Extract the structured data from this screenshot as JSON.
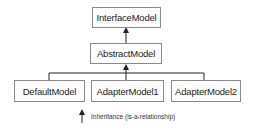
{
  "diagram": {
    "nodes": [
      {
        "id": "interface",
        "label": "InterfaceModel"
      },
      {
        "id": "abstract",
        "label": "AbstractModel"
      },
      {
        "id": "default",
        "label": "DefaultModel"
      },
      {
        "id": "adapter1",
        "label": "AdapterModel1"
      },
      {
        "id": "adapter2",
        "label": "AdapterModel2"
      }
    ],
    "edges": [
      {
        "from": "abstract",
        "to": "interface",
        "type": "inheritance"
      },
      {
        "from": "default",
        "to": "abstract",
        "type": "inheritance"
      },
      {
        "from": "adapter1",
        "to": "abstract",
        "type": "inheritance"
      },
      {
        "from": "adapter2",
        "to": "abstract",
        "type": "inheritance"
      }
    ],
    "legend": {
      "label": "Inheritance (is-a-relationship)",
      "icon": "arrow-up-icon"
    },
    "colors": {
      "line": "#222222",
      "border": "#8a8a8a",
      "background": "#ffffff"
    }
  }
}
